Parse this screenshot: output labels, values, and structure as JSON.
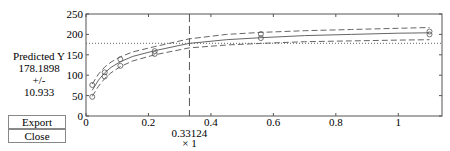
{
  "readout": {
    "label": "Predicted Y",
    "value": "178.1898",
    "pm": "+/-",
    "ci": "10.933"
  },
  "buttons": {
    "export": "Export",
    "close": "Close"
  },
  "x_readout": {
    "value": "0.33124",
    "label": "x 1"
  },
  "chart_data": {
    "type": "line",
    "title": "",
    "xlabel": "x 1",
    "ylabel": "Predicted Y",
    "xlim": [
      0,
      1.14
    ],
    "ylim": [
      0,
      250
    ],
    "xticks": [
      0,
      0.2,
      0.4,
      0.6,
      0.8,
      1
    ],
    "xtick_labels": [
      "0",
      "0.2",
      "0.4",
      "0.6",
      "0.8",
      "1"
    ],
    "yticks": [
      0,
      50,
      100,
      150,
      200,
      250
    ],
    "ytick_labels": [
      "0",
      "50",
      "100",
      "150",
      "200",
      "250"
    ],
    "grid": false,
    "crosshair": {
      "x": 0.33124,
      "y": 178.1898,
      "ci": 10.933
    },
    "observed": {
      "x": [
        0.02,
        0.02,
        0.06,
        0.06,
        0.11,
        0.11,
        0.22,
        0.22,
        0.56,
        0.56,
        1.1,
        1.1
      ],
      "y": [
        47,
        76,
        97,
        107,
        123,
        139,
        152,
        159,
        191,
        201,
        200,
        207
      ]
    },
    "series": [
      {
        "name": "fit",
        "style": "solid",
        "x": [
          0.02,
          0.04,
          0.06,
          0.08,
          0.11,
          0.15,
          0.22,
          0.33,
          0.45,
          0.56,
          0.7,
          0.85,
          1.0,
          1.1
        ],
        "y": [
          63,
          88,
          106,
          119,
          133,
          146,
          160,
          178,
          187,
          192,
          197,
          200,
          203,
          204
        ]
      },
      {
        "name": "upper",
        "style": "dashed",
        "x": [
          0.02,
          0.04,
          0.06,
          0.08,
          0.11,
          0.15,
          0.22,
          0.33,
          0.45,
          0.56,
          0.7,
          0.85,
          1.0,
          1.1
        ],
        "y": [
          78,
          103,
          120,
          132,
          145,
          157,
          170,
          189,
          200,
          205,
          209,
          212,
          215,
          217
        ]
      },
      {
        "name": "lower",
        "style": "dashed",
        "x": [
          0.02,
          0.04,
          0.06,
          0.08,
          0.11,
          0.15,
          0.22,
          0.33,
          0.45,
          0.56,
          0.7,
          0.85,
          1.0,
          1.1
        ],
        "y": [
          48,
          73,
          92,
          106,
          121,
          135,
          150,
          167,
          174,
          178,
          182,
          184,
          186,
          187
        ]
      }
    ]
  }
}
